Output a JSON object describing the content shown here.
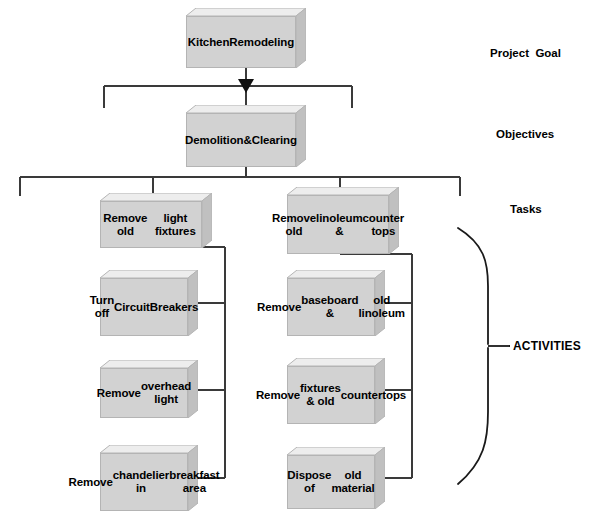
{
  "diagram": {
    "title_text": "Kitchen Remodeling Work Breakdown Structure",
    "level_labels": [
      {
        "id": "project-goal",
        "text": "Project  Goal"
      },
      {
        "id": "objectives",
        "text": "Objectives"
      },
      {
        "id": "tasks",
        "text": "Tasks"
      },
      {
        "id": "activities",
        "text": "ACTIVITIES"
      }
    ],
    "nodes": {
      "goal": {
        "text": "Kitchen\nRemodeling",
        "lines": [
          "Kitchen",
          "Remodeling"
        ]
      },
      "objective": {
        "text": "Demolition\n&\nClearing",
        "lines": [
          "Demolition",
          "&",
          "Clearing"
        ]
      },
      "task_left": {
        "text": "Remove old\nlight fixtures",
        "lines": [
          "Remove old",
          "light fixtures"
        ]
      },
      "task_right": {
        "text": "Remove old\nlinoleum &\ncounter tops",
        "lines": [
          "Remove old",
          "linoleum &",
          "counter tops"
        ]
      },
      "activity_l1": {
        "text": "Turn off\nCircuit\nBreakers",
        "lines": [
          "Turn off",
          "Circuit",
          "Breakers"
        ]
      },
      "activity_l2": {
        "text": "Remove\noverhead light",
        "lines": [
          "Remove",
          "overhead light"
        ]
      },
      "activity_l3": {
        "text": "Remove\nchandelier in\nbreakfast area",
        "lines": [
          "Remove",
          "chandelier in",
          "breakfast area"
        ]
      },
      "activity_r1": {
        "text": "Remove\nbaseboard &\nold linoleum",
        "lines": [
          "Remove",
          "baseboard &",
          "old linoleum"
        ]
      },
      "activity_r2": {
        "text": "Remove\nfixtures & old\ncountertops",
        "lines": [
          "Remove",
          "fixtures & old",
          "countertops"
        ]
      },
      "activity_r3": {
        "text": "Dispose of\nold material",
        "lines": [
          "Dispose of",
          "old material"
        ]
      }
    },
    "colors": {
      "box_front": "#d2d2d2",
      "box_top": "#ededed",
      "box_side": "#c0c0c0",
      "box_border": "#b4b4b4",
      "line": "#3a3a3a",
      "text": "#000000",
      "background": "#ffffff"
    }
  }
}
